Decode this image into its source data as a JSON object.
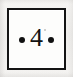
{
  "figure": {
    "type": "boxed-number-label",
    "number": "4",
    "left_bullet": "bullet-dot-icon",
    "right_bullet": "bullet-dot-icon",
    "border_color": "#141414",
    "text_color": "#121212",
    "box_fill": "#fdfdfc",
    "page_background": "#f2f1ef"
  }
}
